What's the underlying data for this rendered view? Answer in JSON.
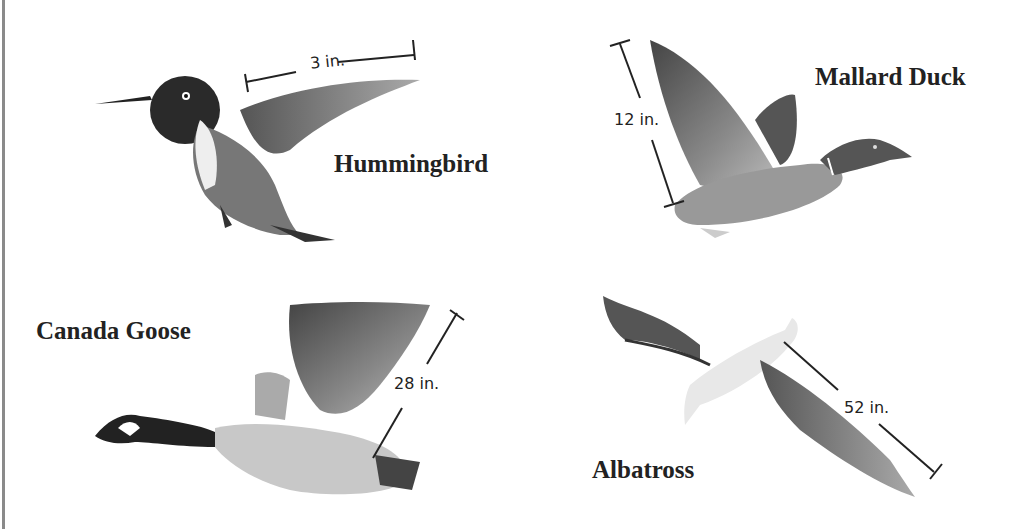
{
  "figure": {
    "birds": [
      {
        "name": "Hummingbird",
        "wingspan_label": "3 in.",
        "wingspan_in": 3
      },
      {
        "name": "Mallard Duck",
        "wingspan_label": "12 in.",
        "wingspan_in": 12
      },
      {
        "name": "Canada Goose",
        "wingspan_label": "28 in.",
        "wingspan_in": 28
      },
      {
        "name": "Albatross",
        "wingspan_label": "52 in.",
        "wingspan_in": 52
      }
    ],
    "colors": {
      "text": "#222222",
      "border": "#8a8a8a",
      "background": "#ffffff"
    }
  }
}
